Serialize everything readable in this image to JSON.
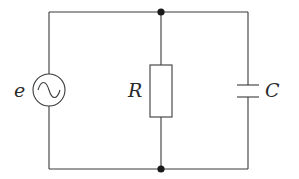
{
  "diagram": {
    "type": "circuit",
    "components": [
      {
        "id": "source",
        "kind": "ac-voltage-source",
        "label": "e",
        "symbol": "~"
      },
      {
        "id": "resistor",
        "kind": "resistor",
        "label": "R"
      },
      {
        "id": "capacitor",
        "kind": "capacitor",
        "label": "C"
      }
    ],
    "nodes": [
      {
        "id": "top-junction",
        "kind": "junction-dot"
      },
      {
        "id": "bottom-junction",
        "kind": "junction-dot"
      }
    ],
    "labels": {
      "source": "e",
      "resistor": "R",
      "capacitor": "C"
    },
    "colors": {
      "wire": "#3a3a3a",
      "dot": "#1a1a1a",
      "background": "#ffffff"
    }
  }
}
